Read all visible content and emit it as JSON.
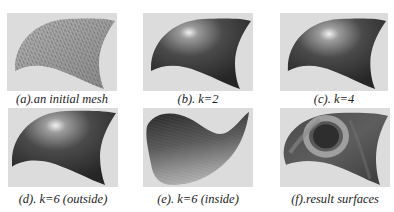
{
  "figure": {
    "panels": [
      {
        "id": "a",
        "caption": "(a).an initial mesh",
        "rendering": "wireframe-mesh"
      },
      {
        "id": "b",
        "caption": "(b). k=2",
        "rendering": "shaded-surface"
      },
      {
        "id": "c",
        "caption": "(c). k=4",
        "rendering": "shaded-surface"
      },
      {
        "id": "d",
        "caption": "(d). k=6 (outside)",
        "rendering": "shaded-surface"
      },
      {
        "id": "e",
        "caption": "(e). k=6 (inside)",
        "rendering": "shaded-surface-inside"
      },
      {
        "id": "f",
        "caption": "(f).result surfaces",
        "rendering": "curvature-map"
      }
    ]
  },
  "colors": {
    "panel_background": "#dcdcdc",
    "surface_dark": "#3a3a3a",
    "surface_highlight": "#e8e8e8",
    "mesh_line": "#555555",
    "caption_text": "#222222"
  }
}
